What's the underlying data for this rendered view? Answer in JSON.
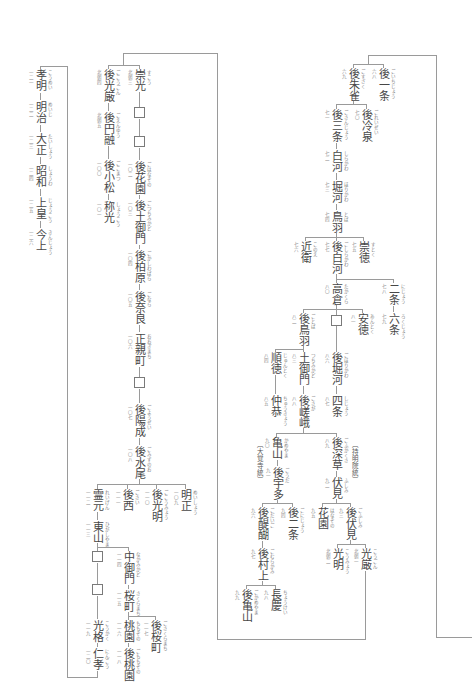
{
  "emperors": {
    "go_ichijo": {
      "name": "後一条",
      "num": "六八",
      "kana": "ごいちじょう"
    },
    "go_suzaku": {
      "name": "後朱雀",
      "num": "六九",
      "kana": "ごすざく"
    },
    "go_reizei": {
      "name": "後冷泉",
      "num": "七〇",
      "kana": "ごれいぜい"
    },
    "go_sanjo": {
      "name": "後三条",
      "num": "七一",
      "kana": "ごさんじょう"
    },
    "shirakawa": {
      "name": "白河",
      "num": "七二",
      "kana": "しらかわ"
    },
    "horikawa": {
      "name": "堀河",
      "num": "七三",
      "kana": "ほりかわ"
    },
    "toba": {
      "name": "鳥羽",
      "num": "七四",
      "kana": "とば"
    },
    "sutoku": {
      "name": "崇徳",
      "num": "七五",
      "kana": "すとく"
    },
    "konoe": {
      "name": "近衛",
      "num": "七六",
      "kana": "このえ"
    },
    "go_shirakawa": {
      "name": "後白河",
      "num": "七七",
      "kana": "ごしらかわ"
    },
    "nijo": {
      "name": "二条",
      "num": "七八",
      "kana": "にじょう"
    },
    "rokujo": {
      "name": "六条",
      "num": "七九",
      "kana": "ろくじょう"
    },
    "takakura": {
      "name": "高倉",
      "num": "八〇",
      "kana": "たかくら"
    },
    "antoku": {
      "name": "安徳",
      "num": "八一",
      "kana": "あんとく"
    },
    "go_toba": {
      "name": "後鳥羽",
      "num": "八二",
      "kana": "ごとば"
    },
    "tsuchimikado": {
      "name": "土御門",
      "num": "八三",
      "kana": "つちみかど"
    },
    "juntoku": {
      "name": "順徳",
      "num": "八四",
      "kana": "じゅんとく"
    },
    "chukyo": {
      "name": "仲恭",
      "num": "八五",
      "kana": "ちゅうきょう"
    },
    "go_horikawa": {
      "name": "後堀河",
      "num": "八六",
      "kana": "ごほりかわ"
    },
    "shijo": {
      "name": "四条",
      "num": "八七",
      "kana": "しじょう"
    },
    "go_saga": {
      "name": "後嵯峨",
      "num": "八八",
      "kana": "ごさが"
    },
    "go_fukakusa": {
      "name": "後深草",
      "num": "八九",
      "kana": "ごふかくさ"
    },
    "kameyama": {
      "name": "亀山",
      "num": "九〇",
      "kana": "かめやま"
    },
    "go_uda": {
      "name": "後宇多",
      "num": "九一",
      "kana": "ごうだ"
    },
    "fushimi": {
      "name": "伏見",
      "num": "九二",
      "kana": "ふしみ"
    },
    "go_fushimi": {
      "name": "後伏見",
      "num": "九三",
      "kana": "ごふしみ"
    },
    "go_nijo": {
      "name": "後二条",
      "num": "九四",
      "kana": "ごにじょう"
    },
    "hanazono": {
      "name": "花園",
      "num": "九五",
      "kana": "はなぞの"
    },
    "go_daigo": {
      "name": "後醍醐",
      "num": "九六",
      "kana": "ごだいご"
    },
    "go_murakami": {
      "name": "後村上",
      "num": "九七",
      "kana": "ごむらかみ"
    },
    "chokei": {
      "name": "長慶",
      "num": "九八",
      "kana": "ちょうけい"
    },
    "go_kameyama": {
      "name": "後亀山",
      "num": "九九",
      "kana": "ごかめやま"
    },
    "kogon": {
      "name": "光厳",
      "num": "北朝一",
      "kana": "こうごん"
    },
    "komyo": {
      "name": "光明",
      "num": "北朝二",
      "kana": "こうみょう"
    },
    "suko": {
      "name": "崇光",
      "num": "北朝三",
      "kana": "すこう"
    },
    "go_kogon": {
      "name": "後光厳",
      "num": "北朝四",
      "kana": "ごこうごん"
    },
    "go_enyu": {
      "name": "後円融",
      "num": "北朝五",
      "kana": "ごえんゆう"
    },
    "go_komatsu": {
      "name": "後小松",
      "num": "一〇〇",
      "kana": "ごこまつ"
    },
    "shoko": {
      "name": "称光",
      "num": "一〇一",
      "kana": "しょうこう"
    },
    "go_hanazono": {
      "name": "後花園",
      "num": "一〇二",
      "kana": "ごはなぞの"
    },
    "go_tsuchimikado": {
      "name": "後土御門",
      "num": "一〇三",
      "kana": "ごつちみかど"
    },
    "go_kashiwabara": {
      "name": "後柏原",
      "num": "一〇四",
      "kana": "ごかしわばら"
    },
    "go_nara": {
      "name": "後奈良",
      "num": "一〇五",
      "kana": "ごなら"
    },
    "ogimachi": {
      "name": "正親町",
      "num": "一〇六",
      "kana": "おおぎまち"
    },
    "go_yozei": {
      "name": "後陽成",
      "num": "一〇七",
      "kana": "ごようぜい"
    },
    "go_mizunoo": {
      "name": "後水尾",
      "num": "一〇八",
      "kana": "ごみずのお"
    },
    "meisho": {
      "name": "明正",
      "num": "一〇九",
      "kana": "めいしょう"
    },
    "go_komyo": {
      "name": "後光明",
      "num": "一一〇",
      "kana": "ごこうみょう"
    },
    "go_sai": {
      "name": "後西",
      "num": "一一一",
      "kana": "ごさい"
    },
    "reigen": {
      "name": "霊元",
      "num": "一一二",
      "kana": "れいげん"
    },
    "higashiyama": {
      "name": "東山",
      "num": "一一三",
      "kana": "ひがしやま"
    },
    "nakamikado": {
      "name": "中御門",
      "num": "一一四",
      "kana": "なかみかど"
    },
    "sakuramachi": {
      "name": "桜町",
      "num": "一一五",
      "kana": "さくらまち"
    },
    "momozono": {
      "name": "桃園",
      "num": "一一六",
      "kana": "ももぞの"
    },
    "go_sakuramachi": {
      "name": "後桜町",
      "num": "一一七",
      "kana": "ごさくらまち"
    },
    "go_momozono": {
      "name": "後桃園",
      "num": "一一八",
      "kana": "ごももぞの"
    },
    "kokaku": {
      "name": "光格",
      "num": "一一九",
      "kana": "こうかく"
    },
    "ninko": {
      "name": "仁孝",
      "num": "一二〇",
      "kana": "にんこう"
    },
    "komei": {
      "name": "孝明",
      "num": "一二一",
      "kana": "こうめい"
    },
    "meiji": {
      "name": "明治",
      "num": "一二二",
      "kana": "めいじ"
    },
    "taisho": {
      "name": "大正",
      "num": "一二三",
      "kana": "たいしょう"
    },
    "showa": {
      "name": "昭和",
      "num": "一二四",
      "kana": "しょうわ"
    },
    "jokou": {
      "name": "上皇",
      "num": "一二五",
      "kana": "じょうこう"
    },
    "kinjo": {
      "name": "今上",
      "num": "一二六",
      "kana": "きんじょう"
    }
  },
  "lineage_labels": {
    "daikakuji": "〔大覚寺統〕",
    "jimyoin": "〔持明院統〕"
  },
  "lineage": [
    {
      "parent": "(previous page)",
      "children": [
        "後一条",
        "後朱雀"
      ]
    },
    {
      "parent": "後朱雀",
      "children": [
        "後三条",
        "後冷泉"
      ]
    },
    {
      "parent": "後三条",
      "children": [
        "白河"
      ]
    },
    {
      "parent": "白河",
      "children": [
        "堀河"
      ]
    },
    {
      "parent": "堀河",
      "children": [
        "鳥羽"
      ]
    },
    {
      "parent": "鳥羽",
      "children": [
        "近衛",
        "後白河",
        "崇徳"
      ]
    },
    {
      "parent": "後白河",
      "children": [
        "高倉",
        "二条"
      ]
    },
    {
      "parent": "二条",
      "children": [
        "六条"
      ]
    },
    {
      "parent": "高倉",
      "children": [
        "後鳥羽",
        "□",
        "安徳"
      ]
    },
    {
      "parent": "後鳥羽",
      "children": [
        "順徳",
        "土御門"
      ]
    },
    {
      "parent": "順徳",
      "children": [
        "仲恭"
      ]
    },
    {
      "parent": "土御門",
      "children": [
        "後嵯峨"
      ]
    },
    {
      "parent": "□",
      "children": [
        "後堀河"
      ]
    },
    {
      "parent": "後堀河",
      "children": [
        "四条"
      ]
    },
    {
      "parent": "後嵯峨",
      "children": [
        "亀山",
        "後深草"
      ]
    },
    {
      "parent": "亀山",
      "children": [
        "後宇多"
      ]
    },
    {
      "parent": "後宇多",
      "children": [
        "後醍醐",
        "後二条"
      ]
    },
    {
      "parent": "後醍醐",
      "children": [
        "後村上"
      ]
    },
    {
      "parent": "後村上",
      "children": [
        "後亀山",
        "長慶"
      ]
    },
    {
      "parent": "後深草",
      "children": [
        "伏見"
      ]
    },
    {
      "parent": "伏見",
      "children": [
        "花園",
        "後伏見"
      ]
    },
    {
      "parent": "後伏見",
      "children": [
        "光明",
        "光厳"
      ]
    },
    {
      "parent": "光厳",
      "children": [
        "後光厳",
        "崇光"
      ]
    },
    {
      "parent": "後光厳",
      "children": [
        "後円融"
      ]
    },
    {
      "parent": "後円融",
      "children": [
        "後小松"
      ]
    },
    {
      "parent": "後小松",
      "children": [
        "称光"
      ]
    },
    {
      "parent": "崇光",
      "children": [
        "□"
      ]
    },
    {
      "parent": "□",
      "children": [
        "□"
      ]
    },
    {
      "parent": "□",
      "children": [
        "後花園"
      ]
    },
    {
      "parent": "後花園",
      "children": [
        "後土御門"
      ]
    },
    {
      "parent": "後土御門",
      "children": [
        "後柏原"
      ]
    },
    {
      "parent": "後柏原",
      "children": [
        "後奈良"
      ]
    },
    {
      "parent": "後奈良",
      "children": [
        "正親町"
      ]
    },
    {
      "parent": "正親町",
      "children": [
        "□"
      ]
    },
    {
      "parent": "□",
      "children": [
        "後陽成"
      ]
    },
    {
      "parent": "後陽成",
      "children": [
        "後水尾"
      ]
    },
    {
      "parent": "後水尾",
      "children": [
        "霊元",
        "後西",
        "後光明",
        "明正"
      ]
    },
    {
      "parent": "霊元",
      "children": [
        "東山"
      ]
    },
    {
      "parent": "東山",
      "children": [
        "□",
        "中御門"
      ]
    },
    {
      "parent": "□",
      "children": [
        "□"
      ]
    },
    {
      "parent": "□",
      "children": [
        "光格"
      ]
    },
    {
      "parent": "光格",
      "children": [
        "仁孝"
      ]
    },
    {
      "parent": "中御門",
      "children": [
        "桜町"
      ]
    },
    {
      "parent": "桜町",
      "children": [
        "桃園",
        "後桜町"
      ]
    },
    {
      "parent": "桃園",
      "children": [
        "後桃園"
      ]
    },
    {
      "parent": "仁孝",
      "children": [
        "孝明"
      ]
    },
    {
      "parent": "孝明",
      "children": [
        "明治"
      ]
    },
    {
      "parent": "明治",
      "children": [
        "大正"
      ]
    },
    {
      "parent": "大正",
      "children": [
        "昭和"
      ]
    },
    {
      "parent": "昭和",
      "children": [
        "上皇"
      ]
    },
    {
      "parent": "上皇",
      "children": [
        "今上"
      ]
    }
  ],
  "colors": {
    "text": "#474747",
    "line": "#9a9a9a",
    "background": "#ffffff"
  }
}
